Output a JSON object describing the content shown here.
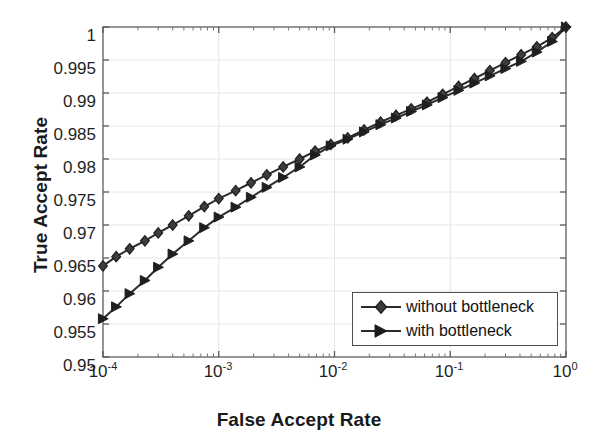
{
  "chart_data": {
    "type": "line",
    "title": "",
    "xlabel": "False Accept Rate",
    "ylabel": "True Accept Rate",
    "xscale": "log",
    "yscale": "linear",
    "xlim": [
      0.0001,
      1
    ],
    "ylim": [
      0.95,
      1
    ],
    "grid": true,
    "legend_position": "lower right",
    "xticks": [
      0.0001,
      0.001,
      0.01,
      0.1,
      1
    ],
    "xtick_labels": [
      "10-4",
      "10-3",
      "10-2",
      "10-1",
      "100"
    ],
    "xtick_mantissa": [
      "10",
      "10",
      "10",
      "10",
      "10"
    ],
    "xtick_exponent": [
      "-4",
      "-3",
      "-2",
      "-1",
      "0"
    ],
    "yticks": [
      0.95,
      0.955,
      0.96,
      0.965,
      0.97,
      0.975,
      0.98,
      0.985,
      0.99,
      0.995,
      1
    ],
    "ytick_labels": [
      "0.95",
      "0.955",
      "0.96",
      "0.965",
      "0.97",
      "0.975",
      "0.98",
      "0.985",
      "0.99",
      "0.995",
      "1"
    ],
    "line_color": "#2b2b2b",
    "series": [
      {
        "name": "without bottleneck",
        "marker": "diamond",
        "color": "#2b2b2b",
        "x": [
          0.0001,
          0.00013,
          0.00017,
          0.00023,
          0.0003,
          0.0004,
          0.00055,
          0.00075,
          0.001,
          0.0014,
          0.0019,
          0.0026,
          0.0036,
          0.005,
          0.0068,
          0.0093,
          0.013,
          0.018,
          0.025,
          0.034,
          0.046,
          0.063,
          0.086,
          0.118,
          0.162,
          0.22,
          0.3,
          0.41,
          0.56,
          0.76,
          1.0
        ],
        "y": [
          0.9638,
          0.9652,
          0.9664,
          0.9676,
          0.9688,
          0.97,
          0.9714,
          0.9728,
          0.974,
          0.9752,
          0.9764,
          0.9776,
          0.9788,
          0.98,
          0.9812,
          0.9822,
          0.9832,
          0.9844,
          0.9856,
          0.9866,
          0.9876,
          0.9886,
          0.9898,
          0.991,
          0.9922,
          0.9934,
          0.9946,
          0.9958,
          0.997,
          0.9984,
          1.0
        ]
      },
      {
        "name": "with bottleneck",
        "marker": "right-triangle",
        "color": "#2b2b2b",
        "x": [
          0.0001,
          0.00013,
          0.00017,
          0.00023,
          0.0003,
          0.0004,
          0.00055,
          0.00075,
          0.001,
          0.0014,
          0.0019,
          0.0026,
          0.0036,
          0.005,
          0.0068,
          0.0093,
          0.013,
          0.018,
          0.025,
          0.034,
          0.046,
          0.063,
          0.086,
          0.118,
          0.162,
          0.22,
          0.3,
          0.41,
          0.56,
          0.76,
          1.0
        ],
        "y": [
          0.9558,
          0.9576,
          0.9596,
          0.9616,
          0.9636,
          0.9656,
          0.9676,
          0.9696,
          0.9712,
          0.9727,
          0.9742,
          0.9757,
          0.9772,
          0.9788,
          0.9806,
          0.982,
          0.983,
          0.9841,
          0.9852,
          0.9862,
          0.9872,
          0.9882,
          0.9893,
          0.9904,
          0.9915,
          0.9926,
          0.9937,
          0.9948,
          0.9962,
          0.9978,
          1.0
        ]
      }
    ]
  },
  "legend": {
    "entries": [
      {
        "label": "without bottleneck",
        "marker": "diamond"
      },
      {
        "label": "with bottleneck",
        "marker": "right-triangle"
      }
    ]
  }
}
